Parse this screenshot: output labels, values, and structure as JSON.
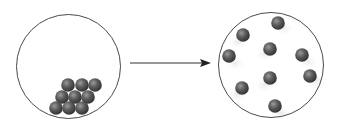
{
  "diagram": {
    "colors": {
      "background": "#ffffff",
      "container_stroke": "#4a4a4a",
      "arrow": "#333333",
      "particle_dark": "#3a3a3a",
      "particle_mid": "#6e6e6e",
      "particle_highlight": "#9a9a9a"
    },
    "particle_radius": 6.8,
    "left_container": {
      "label": "compact state",
      "cx": 68.5,
      "cy": 66.5,
      "r": 52,
      "particles": [
        {
          "x": 68,
          "y": 85
        },
        {
          "x": 82,
          "y": 85
        },
        {
          "x": 95,
          "y": 85
        },
        {
          "x": 62,
          "y": 97
        },
        {
          "x": 75,
          "y": 97
        },
        {
          "x": 88,
          "y": 97
        },
        {
          "x": 56,
          "y": 108
        },
        {
          "x": 69,
          "y": 108
        },
        {
          "x": 82,
          "y": 108
        }
      ]
    },
    "arrow": {
      "label": "transition-arrow",
      "x1": 130,
      "y1": 63,
      "x2": 211,
      "y2": 63
    },
    "right_container": {
      "label": "dispersed state",
      "cx": 271,
      "cy": 65,
      "r": 52.5,
      "particles": [
        {
          "x": 278,
          "y": 23
        },
        {
          "x": 243,
          "y": 35
        },
        {
          "x": 229,
          "y": 56
        },
        {
          "x": 270,
          "y": 49
        },
        {
          "x": 302,
          "y": 55
        },
        {
          "x": 270,
          "y": 78
        },
        {
          "x": 310,
          "y": 76
        },
        {
          "x": 242,
          "y": 88
        },
        {
          "x": 275,
          "y": 106
        }
      ]
    }
  }
}
